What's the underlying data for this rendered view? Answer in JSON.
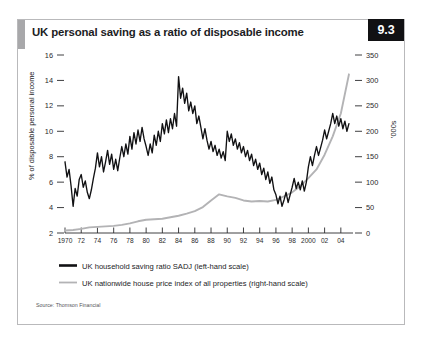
{
  "figure": {
    "number": "9.3",
    "title": "UK personal saving as a ratio of disposable income",
    "source": "Source: Thomson Financial"
  },
  "legend": {
    "items": [
      {
        "label": "UK household saving ratio SADJ (left-hand scale)",
        "color": "#111113",
        "marker": "thick-black-line"
      },
      {
        "label": "UK nationwide house price index of all properties (right-hand scale)",
        "color": "#b3b3b5",
        "marker": "thin-grey-line"
      }
    ]
  },
  "chart_data": {
    "type": "line",
    "title": "UK personal saving as a ratio of disposable income",
    "xlabel": "",
    "ylabel": "% of disposable personal income",
    "y2label": "'000s",
    "xlim": [
      1970,
      2005.5
    ],
    "ylim": [
      2,
      16
    ],
    "y2lim": [
      0,
      350
    ],
    "grid": false,
    "legend_position": "below-axes",
    "yticks": [
      2,
      4,
      6,
      8,
      10,
      12,
      14,
      16
    ],
    "ytick_labels": [
      "2",
      "4",
      "6",
      "8",
      "10",
      "12",
      "14",
      "16"
    ],
    "y2ticks": [
      0,
      50,
      100,
      150,
      200,
      250,
      300,
      350
    ],
    "y2tick_labels": [
      "0",
      "50",
      "100",
      "150",
      "200",
      "250",
      "300",
      "350"
    ],
    "xticks": [
      1970,
      1972,
      1974,
      1976,
      1978,
      1980,
      1982,
      1984,
      1986,
      1988,
      1990,
      1992,
      1994,
      1996,
      1998,
      2000,
      2002,
      2004
    ],
    "xtick_labels": [
      "1970",
      "72",
      "74",
      "76",
      "78",
      "80",
      "82",
      "84",
      "86",
      "88",
      "90",
      "92",
      "94",
      "96",
      "98",
      "2000",
      "02",
      "04"
    ],
    "series": [
      {
        "name": "UK household saving ratio SADJ (left-hand scale)",
        "axis": "left",
        "units": "% of disposable personal income",
        "color": "#111113",
        "x": [
          1970.0,
          1970.25,
          1970.5,
          1970.75,
          1971.0,
          1971.25,
          1971.5,
          1971.75,
          1972.0,
          1972.25,
          1972.5,
          1972.75,
          1973.0,
          1973.25,
          1973.5,
          1973.75,
          1974.0,
          1974.25,
          1974.5,
          1974.75,
          1975.0,
          1975.25,
          1975.5,
          1975.75,
          1976.0,
          1976.25,
          1976.5,
          1976.75,
          1977.0,
          1977.25,
          1977.5,
          1977.75,
          1978.0,
          1978.25,
          1978.5,
          1978.75,
          1979.0,
          1979.25,
          1979.5,
          1979.75,
          1980.0,
          1980.25,
          1980.5,
          1980.75,
          1981.0,
          1981.25,
          1981.5,
          1981.75,
          1982.0,
          1982.25,
          1982.5,
          1982.75,
          1983.0,
          1983.25,
          1983.5,
          1983.75,
          1984.0,
          1984.25,
          1984.5,
          1984.75,
          1985.0,
          1985.25,
          1985.5,
          1985.75,
          1986.0,
          1986.25,
          1986.5,
          1986.75,
          1987.0,
          1987.25,
          1987.5,
          1987.75,
          1988.0,
          1988.25,
          1988.5,
          1988.75,
          1989.0,
          1989.25,
          1989.5,
          1989.75,
          1990.0,
          1990.25,
          1990.5,
          1990.75,
          1991.0,
          1991.25,
          1991.5,
          1991.75,
          1992.0,
          1992.25,
          1992.5,
          1992.75,
          1993.0,
          1993.25,
          1993.5,
          1993.75,
          1994.0,
          1994.25,
          1994.5,
          1994.75,
          1995.0,
          1995.25,
          1995.5,
          1995.75,
          1996.0,
          1996.25,
          1996.5,
          1996.75,
          1997.0,
          1997.25,
          1997.5,
          1997.75,
          1998.0,
          1998.25,
          1998.5,
          1998.75,
          1999.0,
          1999.25,
          1999.5,
          1999.75,
          2000.0,
          2000.25,
          2000.5,
          2000.75,
          2001.0,
          2001.25,
          2001.5,
          2001.75,
          2002.0,
          2002.25,
          2002.5,
          2002.75,
          2003.0,
          2003.25,
          2003.5,
          2003.75,
          2004.0,
          2004.25,
          2004.5,
          2004.75,
          2005.0
        ],
        "y": [
          7.6,
          6.4,
          7.0,
          5.7,
          4.1,
          5.5,
          4.9,
          6.2,
          6.6,
          5.6,
          6.1,
          5.2,
          4.7,
          5.4,
          6.3,
          7.1,
          8.3,
          7.2,
          8.0,
          6.8,
          7.6,
          8.5,
          7.4,
          8.2,
          7.0,
          7.8,
          6.9,
          7.9,
          8.8,
          8.0,
          9.0,
          8.2,
          9.6,
          8.6,
          9.9,
          9.0,
          10.1,
          9.2,
          10.3,
          9.4,
          8.8,
          8.1,
          9.0,
          8.3,
          9.7,
          8.9,
          10.0,
          9.2,
          10.6,
          9.8,
          10.9,
          9.9,
          11.0,
          10.2,
          11.4,
          10.4,
          14.3,
          12.6,
          13.4,
          12.2,
          13.0,
          11.6,
          12.3,
          11.4,
          12.0,
          10.6,
          11.2,
          10.3,
          9.4,
          10.2,
          9.3,
          8.6,
          9.2,
          8.4,
          8.9,
          8.1,
          8.6,
          7.9,
          8.4,
          7.7,
          10.0,
          9.2,
          9.8,
          8.9,
          9.4,
          8.6,
          9.1,
          8.3,
          8.8,
          8.0,
          8.5,
          7.7,
          8.2,
          7.3,
          7.8,
          7.0,
          7.5,
          6.6,
          7.1,
          6.2,
          6.8,
          5.9,
          6.4,
          5.4,
          5.0,
          4.3,
          4.9,
          4.1,
          4.6,
          5.2,
          4.4,
          5.0,
          5.6,
          6.3,
          5.5,
          6.0,
          5.4,
          6.1,
          5.3,
          6.0,
          7.2,
          8.0,
          7.3,
          8.1,
          8.8,
          8.1,
          8.7,
          9.3,
          10.1,
          9.4,
          10.0,
          10.6,
          11.4,
          10.6,
          11.2,
          10.4,
          11.0,
          10.2,
          10.8,
          10.0,
          10.6
        ],
        "notes": "Quarterly series: starts near 7.6 in 1970, dips to ~4 in 1971, rises through the 1970s, peaks about 14.3 in 1980, declines to a trough near 4 in 1988, recovers to about 11.5 in 1992-93, then falls steadily from about 10.5 in 1997 to a 4-6 range from 1999 onward."
      },
      {
        "name": "UK nationwide house price index of all properties (right-hand scale)",
        "axis": "right",
        "units": "'000s",
        "color": "#b3b3b5",
        "x": [
          1970,
          1971,
          1972,
          1973,
          1974,
          1975,
          1976,
          1977,
          1978,
          1979,
          1980,
          1981,
          1982,
          1983,
          1984,
          1985,
          1986,
          1987,
          1988,
          1989,
          1990,
          1991,
          1992,
          1993,
          1994,
          1995,
          1996,
          1997,
          1998,
          1999,
          2000,
          2001,
          2002,
          2003,
          2004,
          2005
        ],
        "y": [
          5,
          6,
          8,
          11,
          12,
          13,
          14,
          16,
          19,
          23,
          26,
          27,
          28,
          31,
          34,
          38,
          43,
          51,
          64,
          76,
          72,
          69,
          64,
          62,
          63,
          62,
          65,
          72,
          80,
          92,
          108,
          125,
          154,
          190,
          235,
          312
        ],
        "notes": "Annual-style smooth grey curve: flat and low through the 1970s, rising to a local peak near 76 thousand in 1989, easing back to about 62 in 1993-95, then climbing steeply to about 310-315 thousand by 2005."
      }
    ]
  }
}
